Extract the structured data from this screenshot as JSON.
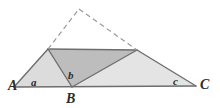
{
  "figure": {
    "background_color": "#ffffff",
    "stroke_color": "#6e6e6e",
    "stroke_color_dark": "#555555",
    "dash_color": "#9a9a9a",
    "fill_light": "#dcdcdc",
    "fill_medium": "#d0d0d0",
    "fill_dark": "#bdbdbd",
    "vertex_labels": [
      {
        "name": "vertex-a",
        "text": "A",
        "x": 8,
        "y": 79
      },
      {
        "name": "vertex-b",
        "text": "B",
        "x": 66,
        "y": 92
      },
      {
        "name": "vertex-c",
        "text": "C",
        "x": 200,
        "y": 78
      }
    ],
    "angle_labels": [
      {
        "name": "angle-a",
        "text": "a",
        "x": 31,
        "y": 77
      },
      {
        "name": "angle-b",
        "text": "b",
        "x": 68,
        "y": 70
      },
      {
        "name": "angle-c",
        "text": "c",
        "x": 173,
        "y": 76
      }
    ],
    "points": {
      "A": [
        14,
        87
      ],
      "B": [
        72,
        87
      ],
      "C": [
        196,
        86
      ],
      "D": [
        48,
        49
      ],
      "E": [
        137,
        50
      ],
      "apex": [
        79,
        9
      ]
    },
    "polygons": [
      {
        "name": "triangle-a-d-b",
        "pts": "14,87 48,49 72,87",
        "fill": "#dcdcdc"
      },
      {
        "name": "triangle-d-b-e",
        "pts": "48,49 72,87 137,50",
        "fill": "#bdbdbd"
      },
      {
        "name": "triangle-b-e-c",
        "pts": "72,87 137,50 196,86",
        "fill": "#e4e4e4"
      }
    ],
    "solid_edges": [
      {
        "name": "edge-a-c",
        "x1": 14,
        "y1": 87,
        "x2": 196,
        "y2": 86
      },
      {
        "name": "edge-a-d",
        "x1": 14,
        "y1": 87,
        "x2": 48,
        "y2": 49
      },
      {
        "name": "edge-d-e",
        "x1": 48,
        "y1": 49,
        "x2": 137,
        "y2": 50
      },
      {
        "name": "edge-d-b",
        "x1": 48,
        "y1": 49,
        "x2": 72,
        "y2": 87
      },
      {
        "name": "edge-b-e",
        "x1": 72,
        "y1": 87,
        "x2": 137,
        "y2": 50
      },
      {
        "name": "edge-e-c",
        "x1": 137,
        "y1": 50,
        "x2": 196,
        "y2": 86
      }
    ],
    "dashed_edges": [
      {
        "name": "dashed-d-apex",
        "x1": 48,
        "y1": 49,
        "x2": 79,
        "y2": 9
      },
      {
        "name": "dashed-apex-e",
        "x1": 79,
        "y1": 9,
        "x2": 137,
        "y2": 50
      }
    ]
  }
}
